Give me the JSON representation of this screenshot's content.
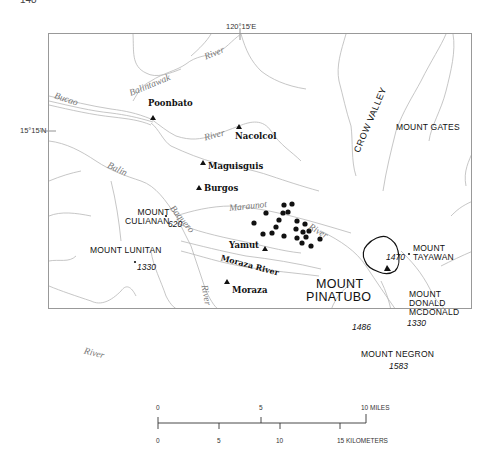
{
  "page": {
    "number": "148"
  },
  "coordinates": {
    "longitude_label": "120°15'E",
    "latitude_label": "15°15'N"
  },
  "rivers": [
    {
      "name": "Balintawak",
      "label": "Balintawak"
    },
    {
      "name": "Balintawak-river",
      "label": "River"
    },
    {
      "name": "Bucao",
      "label": "Bucao"
    },
    {
      "name": "Nacolcol-river",
      "label": "River"
    },
    {
      "name": "Balin",
      "label": "Balin"
    },
    {
      "name": "Baquero",
      "label": "Baquero"
    },
    {
      "name": "Maraunot",
      "label": "Maraunot"
    },
    {
      "name": "Maraunot-river",
      "label": "River"
    },
    {
      "name": "Moraza",
      "label": "Moraza River"
    },
    {
      "name": "south-river",
      "label": "River"
    },
    {
      "name": "southwest-river",
      "label": "River"
    }
  ],
  "towns": [
    {
      "name": "Poonbato",
      "label": "Poonbato"
    },
    {
      "name": "Nacolcol",
      "label": "Nacolcol"
    },
    {
      "name": "Maguisguis",
      "label": "Maguisguis"
    },
    {
      "name": "Burgos",
      "label": "Burgos"
    },
    {
      "name": "Yamut",
      "label": "Yamut"
    },
    {
      "name": "Moraza",
      "label": "Moraza"
    }
  ],
  "mountains": [
    {
      "name": "Mount Culianan",
      "line1": "MOUNT",
      "line2": "CULIANAN",
      "elevation": "620"
    },
    {
      "name": "Mount Lunitan",
      "line1": "MOUNT LUNITAN",
      "elevation": "1330"
    },
    {
      "name": "Mount Tayawan",
      "line1": "MOUNT",
      "line2": "TAYAWAN",
      "elevation": "1470"
    },
    {
      "name": "Mount Donald McDonald",
      "line1": "MOUNT",
      "line2": "DONALD",
      "line3": "MCDONALD",
      "elevation": "1330"
    },
    {
      "name": "Mount Negron",
      "line1": "MOUNT NEGRON",
      "elevation": "1583"
    },
    {
      "name": "Mount Gates",
      "line1": "MOUNT GATES"
    },
    {
      "name": "Mount Pinatubo",
      "line1": "MOUNT",
      "line2": "PINATUBO",
      "elevation": "1486"
    }
  ],
  "valley": {
    "label": "CROW VALLEY"
  },
  "scale_bar": {
    "miles": {
      "ticks": [
        "0",
        "5"
      ],
      "end_label": "10 MILES"
    },
    "kilometers": {
      "ticks": [
        "0",
        "5",
        "10"
      ],
      "end_label": "15 KILOMETERS"
    }
  },
  "colors": {
    "rivers": "#b0b0b0",
    "frame": "#999999",
    "markers": "#111111"
  }
}
